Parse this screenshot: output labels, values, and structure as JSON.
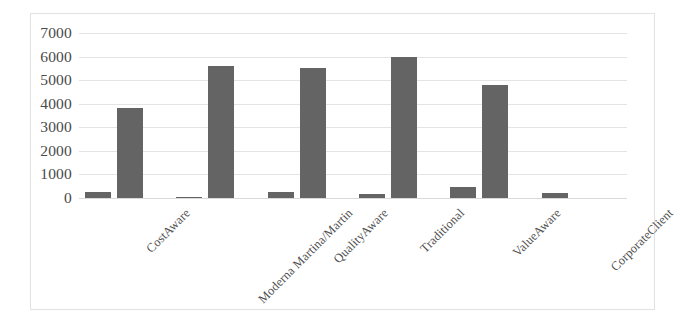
{
  "chart_data": {
    "type": "bar",
    "title": "",
    "subtitle": "",
    "xlabel": "",
    "ylabel": "",
    "grid": true,
    "legend": "none",
    "ylim": [
      0,
      7000
    ],
    "yticks": [
      0,
      1000,
      2000,
      3000,
      4000,
      5000,
      6000,
      7000
    ],
    "ytick_labels": [
      "0",
      "1000",
      "2000",
      "3000",
      "4000",
      "5000",
      "6000",
      "7000"
    ],
    "categories": [
      "CostAware",
      "Moderna Martina/Martin",
      "QualityAware",
      "Traditional",
      "ValueAware",
      "CorporateClient"
    ],
    "series": [
      {
        "name": "series-1",
        "color": "#646464",
        "values": [
          250,
          60,
          250,
          150,
          450,
          200
        ]
      },
      {
        "name": "series-2",
        "color": "#646464",
        "values": [
          3800,
          5600,
          5500,
          6000,
          4800,
          0
        ]
      }
    ],
    "bar_color": "#646464",
    "grid_color": "#e4e4e6",
    "border_color": "#e2e2e4",
    "background": "#ffffff",
    "xlabel_rotation": -45
  }
}
